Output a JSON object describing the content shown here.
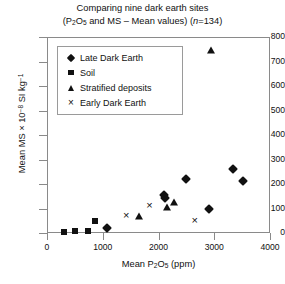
{
  "chart_data": {
    "type": "scatter",
    "title": "Comparing nine dark earth sites",
    "subtitle": "(P2O5 and MS – Mean values) (n=134)",
    "title_line1": "Comparing nine dark earth sites",
    "sub_prefix": "(P",
    "sub_mid": "O",
    "sub_after": " and MS – Mean values) (",
    "sub_n": "n",
    "sub_end": "=134)",
    "xlabel_prefix": "Mean P",
    "xlabel_sub1": "2",
    "xlabel_mid": "O",
    "xlabel_sub2": "5",
    "xlabel_suffix": " (ppm)",
    "xlabel": "Mean P2O5 (ppm)",
    "ylabel_prefix": "Mean MS × 10",
    "ylabel_sup": "−8",
    "ylabel_suffix": " SI kg",
    "ylabel_sup2": "−1",
    "ylabel": "Mean MS × 10−8 SI kg−1",
    "xlim": [
      0,
      4000
    ],
    "ylim": [
      0,
      800
    ],
    "xticks": [
      0,
      1000,
      2000,
      3000,
      4000
    ],
    "yticks": [
      0,
      100,
      200,
      300,
      400,
      500,
      600,
      700,
      800
    ],
    "xtick_labels": [
      "0",
      "1000",
      "2000",
      "3000",
      "4000"
    ],
    "ytick_labels": [
      "0",
      "100",
      "200",
      "300",
      "400",
      "500",
      "600",
      "700",
      "800"
    ],
    "grid": false,
    "legend_position": "upper-left-inside",
    "marker_color": "#111111",
    "axis_color": "#8a8a8a",
    "series": [
      {
        "name": "Late Dark Earth",
        "marker": "diamond",
        "points": [
          [
            1080,
            20
          ],
          [
            2100,
            155
          ],
          [
            2110,
            143
          ],
          [
            2500,
            222
          ],
          [
            2900,
            100
          ],
          [
            3340,
            263
          ],
          [
            3510,
            211
          ]
        ]
      },
      {
        "name": "Soil",
        "marker": "square",
        "points": [
          [
            300,
            5
          ],
          [
            500,
            10
          ],
          [
            730,
            10
          ],
          [
            860,
            47
          ]
        ]
      },
      {
        "name": "Stratified deposits",
        "marker": "triangle",
        "points": [
          [
            1650,
            70
          ],
          [
            2150,
            105
          ],
          [
            2270,
            127
          ],
          [
            2950,
            745
          ]
        ]
      },
      {
        "name": "Early Dark Earth",
        "marker": "cross",
        "points": [
          [
            1420,
            72
          ],
          [
            1840,
            113
          ],
          [
            2650,
            55
          ]
        ]
      }
    ]
  },
  "legend": {
    "items": [
      {
        "label": "Late Dark Earth",
        "marker": "diamond"
      },
      {
        "label": "Soil",
        "marker": "square"
      },
      {
        "label": "Stratified deposits",
        "marker": "triangle"
      },
      {
        "label": "Early Dark Earth",
        "marker": "cross"
      }
    ]
  }
}
